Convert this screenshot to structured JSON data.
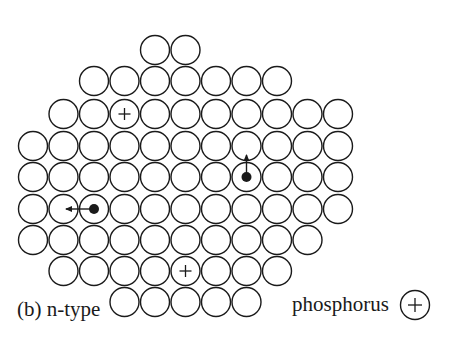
{
  "figure": {
    "caption": "(b) n-type",
    "legend": {
      "label": "phosphorus",
      "symbol": "+"
    }
  },
  "lattice": {
    "pitch": 30.5,
    "radius": 14.5,
    "origin_x": 33,
    "row_y": [
      50,
      81,
      114,
      146,
      177,
      209,
      240,
      271,
      302
    ],
    "rows": [
      {
        "from": 4,
        "to": 5
      },
      {
        "from": 2,
        "to": 8
      },
      {
        "from": 1,
        "to": 10
      },
      {
        "from": 0,
        "to": 10
      },
      {
        "from": 0,
        "to": 10
      },
      {
        "from": 0,
        "to": 10
      },
      {
        "from": 0,
        "to": 9
      },
      {
        "from": 1,
        "to": 8
      },
      {
        "from": 3,
        "to": 7
      }
    ],
    "phosphorus_ions": [
      {
        "row": 2,
        "col": 3
      },
      {
        "row": 7,
        "col": 5
      }
    ],
    "free_electrons": [
      {
        "row": 4,
        "col": 7,
        "direction": "up"
      },
      {
        "row": 5,
        "col": 2,
        "direction": "left"
      }
    ]
  },
  "colors": {
    "stroke": "#1a1a1a",
    "fill": "#ffffff"
  }
}
